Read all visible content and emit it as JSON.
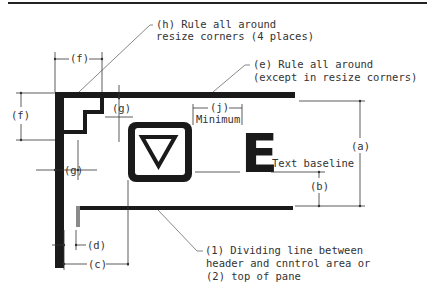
{
  "diagram": {
    "callouts": {
      "h": {
        "line1": "(h) Rule all around",
        "line2": "resize corners (4 places)"
      },
      "e": {
        "line1": "(e) Rule all around",
        "line2": "(except in resize corners)"
      },
      "divider": {
        "line1": "(1) Dividing line between",
        "line2": "header and cnntrol area or",
        "line3": "(2) top of pane"
      }
    },
    "dimensions": {
      "a": "(a)",
      "b": "(b)",
      "c": "(c)",
      "d": "(d)",
      "f_top": "(f)",
      "f_left": "(f)",
      "g_top": "(g)",
      "g_left": "(g)",
      "j": "(j)",
      "j_note": "Minimum"
    },
    "labels": {
      "text_baseline": "Text baseline",
      "sample_letter": "E"
    },
    "icons": {
      "control_button": "down-triangle-icon"
    },
    "colors": {
      "rule": "#1a1a1a",
      "line": "#333333",
      "gray_rule": "#8a8a8a",
      "background": "#ffffff"
    }
  }
}
